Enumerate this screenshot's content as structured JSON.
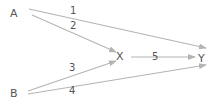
{
  "diagram": {
    "type": "directed-graph",
    "colors": {
      "line": "#b4b4b4",
      "text": "#555555",
      "background": "#ffffff"
    },
    "nodes": [
      {
        "id": "A",
        "label": "A"
      },
      {
        "id": "B",
        "label": "B"
      },
      {
        "id": "X",
        "label": "X"
      },
      {
        "id": "Y",
        "label": "Y"
      }
    ],
    "edges": [
      {
        "id": "e1",
        "from": "A",
        "to": "Y",
        "label": "1"
      },
      {
        "id": "e2",
        "from": "A",
        "to": "X",
        "label": "2"
      },
      {
        "id": "e3",
        "from": "B",
        "to": "X",
        "label": "3"
      },
      {
        "id": "e4",
        "from": "B",
        "to": "Y",
        "label": "4"
      },
      {
        "id": "e5",
        "from": "X",
        "to": "Y",
        "label": "5"
      }
    ]
  }
}
